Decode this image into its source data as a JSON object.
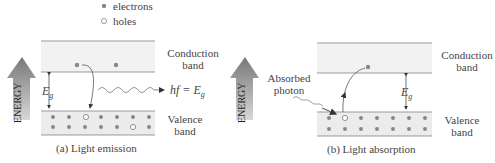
{
  "legend": {
    "electrons": "electrons",
    "holes": "holes"
  },
  "panel_a": {
    "conduction_label_1": "Conduction",
    "conduction_label_2": "band",
    "valence_label_1": "Valence",
    "valence_label_2": "band",
    "gap_label": "E",
    "gap_sub": "g",
    "photon_label": "hf = E",
    "photon_sub": "g",
    "energy_label": "ENERGY",
    "caption": "(a) Light emission"
  },
  "panel_b": {
    "conduction_label_1": "Conduction",
    "conduction_label_2": "band",
    "valence_label_1": "Valence",
    "valence_label_2": "band",
    "gap_label": "E",
    "gap_sub": "g",
    "absorbed_1": "Absorbed",
    "absorbed_2": "photon",
    "energy_label": "ENERGY",
    "caption": "(b) Light absorption"
  },
  "colors": {
    "band_fill": "#efefef",
    "band_line": "#888888",
    "dot": "#888888",
    "arrow": "#8a8a8a"
  }
}
